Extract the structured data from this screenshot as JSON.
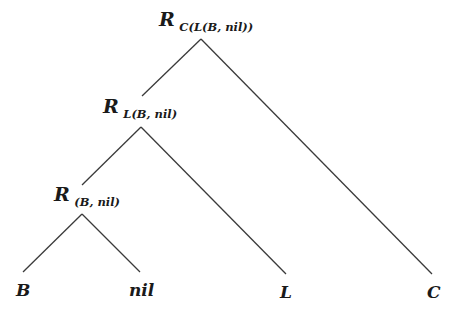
{
  "diagram": {
    "type": "tree",
    "nodes": {
      "root": {
        "symbol": "R",
        "subscript": "C(L(B, nil))"
      },
      "mid": {
        "symbol": "R",
        "subscript": "L(B, nil)"
      },
      "low": {
        "symbol": "R",
        "subscript": "(B, nil)"
      }
    },
    "leaves": {
      "b": "B",
      "nil": "nil",
      "l": "L",
      "c": "C"
    },
    "edges": [
      {
        "from": "root",
        "to": "mid"
      },
      {
        "from": "root",
        "to": "c"
      },
      {
        "from": "mid",
        "to": "low"
      },
      {
        "from": "mid",
        "to": "l"
      },
      {
        "from": "low",
        "to": "b"
      },
      {
        "from": "low",
        "to": "nil"
      }
    ]
  }
}
